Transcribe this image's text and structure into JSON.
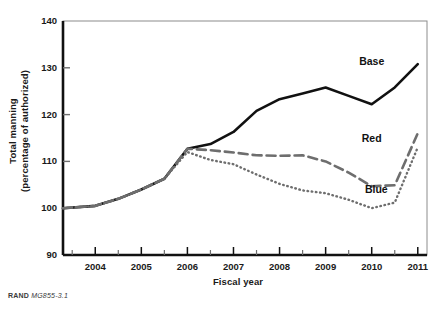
{
  "figure": {
    "source_note_prefix": "RAND",
    "source_note_id": "MG855-3.1"
  },
  "chart_data": {
    "type": "line",
    "title": "",
    "xlabel": "Fiscal year",
    "ylabel": "Total manning\n(percentage of authorized)",
    "ylabel_line1": "Total manning",
    "ylabel_line2": "(percentage of authorized)",
    "xlim": [
      2003.3,
      2011.2
    ],
    "ylim": [
      90,
      140
    ],
    "yticks": [
      90,
      100,
      110,
      120,
      130,
      140
    ],
    "ytick_labels": [
      "90",
      "100",
      "110",
      "120",
      "130",
      "140"
    ],
    "xticks": [
      2004,
      2005,
      2006,
      2007,
      2008,
      2009,
      2010,
      2011
    ],
    "xtick_labels": [
      "2004",
      "2005",
      "2006",
      "2007",
      "2008",
      "2009",
      "2010",
      "2011"
    ],
    "x_minor_ticks": [
      2003.5,
      2004.5,
      2005.5,
      2006.5,
      2007.5,
      2008.5,
      2009.5,
      2010.5
    ],
    "grid": false,
    "legend_position": "inline-right",
    "x": [
      2003.3,
      2004.0,
      2004.5,
      2005.0,
      2005.5,
      2006.0,
      2006.5,
      2007.0,
      2007.5,
      2008.0,
      2008.5,
      2009.0,
      2009.5,
      2010.0,
      2010.5,
      2011.0
    ],
    "series": [
      {
        "name": "Base",
        "style": "solid",
        "color": "#111111",
        "label": "Base",
        "values": [
          100.0,
          100.5,
          102.0,
          104.0,
          106.3,
          112.7,
          113.7,
          116.3,
          120.8,
          123.3,
          124.5,
          125.8,
          124.0,
          122.2,
          125.8,
          130.8
        ]
      },
      {
        "name": "Red",
        "style": "dashed",
        "color": "#6e6e6e",
        "label": "Red",
        "values": [
          100.0,
          100.5,
          102.0,
          104.0,
          106.3,
          112.7,
          112.4,
          111.9,
          111.3,
          111.2,
          111.3,
          110.0,
          107.6,
          104.7,
          104.9,
          116.0
        ]
      },
      {
        "name": "Blue",
        "style": "dotted",
        "color": "#6e6e6e",
        "label": "Blue",
        "values": [
          100.0,
          100.5,
          102.0,
          104.0,
          106.3,
          112.0,
          110.3,
          109.4,
          107.2,
          105.2,
          103.8,
          103.2,
          101.8,
          100.0,
          101.2,
          113.0
        ]
      }
    ],
    "annotations": [
      {
        "text": "Base",
        "x": 2010.0,
        "y": 130.6
      },
      {
        "text": "Red",
        "x": 2010.0,
        "y": 114.2
      },
      {
        "text": "Blue",
        "x": 2010.1,
        "y": 103.3
      }
    ]
  }
}
